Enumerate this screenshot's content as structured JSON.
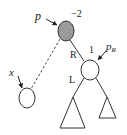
{
  "diagram": {
    "type": "avl-tree-imbalance",
    "nodes": {
      "p": {
        "label": "p",
        "balance": "−2",
        "fill": "#9a9a9a",
        "stroke": "#333333"
      },
      "pR": {
        "label": "p",
        "label_sub": "R",
        "balance": "1",
        "fill": "#ffffff",
        "stroke": "#333333"
      },
      "x": {
        "label": "x",
        "fill": "#ffffff",
        "stroke": "#333333"
      }
    },
    "edges": {
      "p_to_pR": {
        "label": "R",
        "style": "solid"
      },
      "pR_to_left_subtree": {
        "label": "L",
        "style": "solid"
      },
      "p_to_x": {
        "style": "dashed"
      }
    },
    "subtrees": [
      {
        "name": "left-subtree",
        "size": "tall"
      },
      {
        "name": "right-subtree",
        "size": "short"
      }
    ]
  }
}
